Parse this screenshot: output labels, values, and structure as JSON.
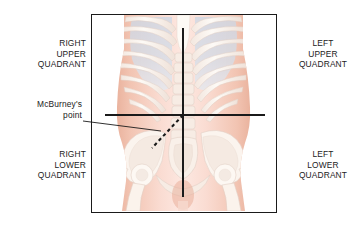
{
  "figure": {
    "background_color": "#ffffff",
    "frame": {
      "border_color": "#1a1a1a",
      "fill_color": "#ffffff"
    },
    "labels": {
      "right_upper_quadrant": "RIGHT\nUPPER\nQUADRANT",
      "left_upper_quadrant": "LEFT\nUPPER\nQUADRANT",
      "right_lower_quadrant": "RIGHT\nLOWER\nQUADRANT",
      "left_lower_quadrant": "LEFT\nLOWER\nQUADRANT",
      "mcburneys_point": "McBurney's\npoint",
      "text_color": "#222222"
    },
    "anatomy": {
      "skin_color": "#f0bca8",
      "skin_center_color": "#fbe3da",
      "bone_color": "#fcf8f2",
      "bone_shadow_color": "#e6d9d2",
      "lung_color": "#c8d4e4",
      "lung_edge_color": "#aebfd6",
      "parts": [
        "rib-cage",
        "lungs",
        "vertebral-column",
        "sternum",
        "pelvis",
        "sacrum",
        "femoral-heads",
        "torso-silhouette"
      ]
    },
    "marker_lines": {
      "vertical_median": {
        "name": "vertical-median-line",
        "color": "#1a1a1a",
        "x": 183,
        "y_start": 28,
        "y_end": 197
      },
      "horizontal_transumbilical": {
        "name": "horizontal-transumbilical-line",
        "color": "#1a1a1a",
        "y": 115,
        "x_start": 105,
        "x_end": 265
      },
      "mcburney_dashed": {
        "name": "mcburney-dashed-line",
        "color": "#1a1a1a",
        "style": "dashed",
        "x_start": 183,
        "y_start": 115,
        "x_end": 152,
        "y_end": 148
      },
      "leader": {
        "name": "mcburney-leader-line",
        "color": "#1a1a1a",
        "x_start": 83,
        "y_start": 121,
        "x_end": 161,
        "y_end": 131
      }
    }
  }
}
